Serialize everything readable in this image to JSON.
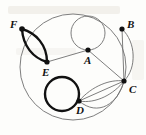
{
  "figure": {
    "background_color": "#fdfdfb",
    "ink_color": "#111111",
    "thin_stroke_color": "#6f6f6f"
  },
  "vertices": [
    {
      "id": "A",
      "label": "A",
      "x": 88,
      "y": 50,
      "label_x": 84,
      "label_y": 55
    },
    {
      "id": "B",
      "label": "B",
      "x": 122,
      "y": 29,
      "label_x": 127,
      "label_y": 19
    },
    {
      "id": "C",
      "label": "C",
      "x": 124,
      "y": 81,
      "label_x": 129,
      "label_y": 84
    },
    {
      "id": "D",
      "label": "D",
      "x": 79,
      "y": 101,
      "label_x": 76,
      "label_y": 105
    },
    {
      "id": "E",
      "label": "E",
      "x": 47,
      "y": 62,
      "label_x": 42,
      "label_y": 67
    },
    {
      "id": "F",
      "label": "F",
      "x": 22,
      "y": 29,
      "label_x": 10,
      "label_y": 19
    }
  ],
  "edges": [
    {
      "name": "edge-F-E-upper",
      "from": "F",
      "to": "E",
      "style": "thick-arc"
    },
    {
      "name": "edge-F-E-lower",
      "from": "F",
      "to": "E",
      "style": "thick-arc"
    },
    {
      "name": "edge-A-E",
      "from": "A",
      "to": "E",
      "style": "thin-straight"
    },
    {
      "name": "edge-A-C",
      "from": "A",
      "to": "C",
      "style": "thin-straight"
    },
    {
      "name": "loop-A",
      "from": "A",
      "to": "A",
      "style": "thin-loop"
    },
    {
      "name": "edge-B-C-straight",
      "from": "B",
      "to": "C",
      "style": "thin-straight"
    },
    {
      "name": "edge-B-C-curve",
      "from": "B",
      "to": "C",
      "style": "thin-arc"
    },
    {
      "name": "edge-D-C-upper",
      "from": "D",
      "to": "C",
      "style": "thin-arc"
    },
    {
      "name": "edge-D-C-middle",
      "from": "D",
      "to": "C",
      "style": "thin-straight"
    },
    {
      "name": "edge-D-C-lower",
      "from": "D",
      "to": "C",
      "style": "thin-arc"
    },
    {
      "name": "loop-D",
      "from": "D",
      "to": "D",
      "style": "thick-loop"
    },
    {
      "name": "outer-circle-F-B",
      "from": "F",
      "to": "B",
      "style": "thin-arc"
    },
    {
      "name": "outer-circle-B-C",
      "from": "B",
      "to": "C",
      "style": "thin-arc"
    },
    {
      "name": "outer-circle-C-F",
      "from": "C",
      "to": "F",
      "style": "thin-arc"
    }
  ],
  "outer_circle": {
    "cx": 73,
    "cy": 67,
    "r": 53
  },
  "loops": [
    {
      "name": "loop-A",
      "cx": 88,
      "cy": 33,
      "r": 17,
      "weight": "thin"
    },
    {
      "name": "loop-D",
      "cx": 62,
      "cy": 94,
      "r": 17,
      "weight": "thick"
    }
  ]
}
